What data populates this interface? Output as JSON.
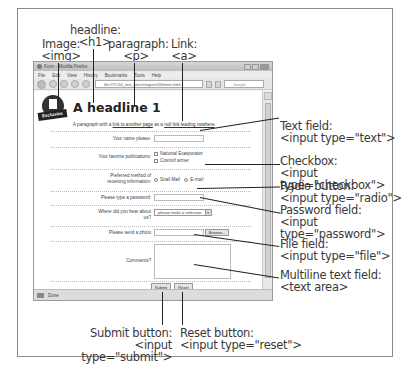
{
  "callouts": {
    "image": {
      "title": "Image:",
      "tag": "<img>"
    },
    "headline": {
      "title": "headline:",
      "tag": "<h1>"
    },
    "paragraph": {
      "title": "paragraph:",
      "tag": "<p>"
    },
    "link": {
      "title": "Link:",
      "tag": "<a>"
    },
    "text_field": {
      "title": "Text field:",
      "tag": "<input type=\"text\">"
    },
    "checkbox": {
      "title": "Checkbox:",
      "tag": "<input type=\"checkbox\">"
    },
    "radio": {
      "title": "Radio button:",
      "tag": "<input type=\"radio\">"
    },
    "password": {
      "title": "Password field:",
      "tag": "<input type=\"password\">"
    },
    "file": {
      "title": "File field:",
      "tag": "<input type=\"file\">"
    },
    "textarea": {
      "title": "Multiline text field:",
      "tag": "<text area>"
    },
    "submit": {
      "title": "Submit button:",
      "tag": "<input type=\"submit\">"
    },
    "reset": {
      "title": "Reset button:",
      "tag": "<input type=\"reset\">"
    }
  },
  "browser": {
    "title": "Form - Mozilla Firefox",
    "menu": [
      "File",
      "Edit",
      "View",
      "History",
      "Bookmarks",
      "Tools",
      "Help"
    ],
    "url": "file:///Y:/04_test_sites/chapter03/forms.html",
    "search_placeholder": "Google",
    "status": "Done"
  },
  "page": {
    "logo_text": "Exclusive",
    "headline": "A headline 1",
    "paragraph": {
      "before": "A paragraph with a ",
      "link1": "link to another page",
      "middle": " as a ",
      "link2": "null link leading nowhere",
      "after": "."
    },
    "form": {
      "name_label": "Your name please:",
      "publications_label": "Your favorite publications:",
      "publications": [
        "National Exasperator",
        "Cosmof armer"
      ],
      "method_label_1": "Preferred method of",
      "method_label_2": "receiving information:",
      "methods": [
        "Snail Mail",
        "E-mail"
      ],
      "password_label": "Please type a password:",
      "hear_label_1": "Where did you hear about",
      "hear_label_2": "us?",
      "hear_select": "-please make a selection-",
      "photo_label": "Please send a photo",
      "browse_label": "Browse...",
      "comments_label": "Comments?",
      "submit_label": "Submit",
      "reset_label": "Reset"
    }
  }
}
